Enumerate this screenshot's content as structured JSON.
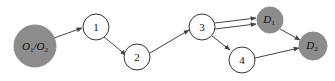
{
  "diagram": {
    "type": "directed-graph",
    "colors": {
      "background": "#ffffff",
      "terminal_fill": "#8c8c8c",
      "plain_fill": "#ffffff",
      "stroke": "#333333",
      "edge": "#444444"
    },
    "nodes": [
      {
        "id": "O",
        "label_main": "O",
        "label_sub1": "1",
        "label_sep": "/O",
        "label_sub2": "2",
        "type": "origin",
        "cx": 35,
        "cy": 46,
        "r": 21
      },
      {
        "id": "n1",
        "label": "1",
        "type": "intermediate",
        "cx": 96,
        "cy": 27,
        "r": 13
      },
      {
        "id": "n2",
        "label": "2",
        "type": "intermediate",
        "cx": 137,
        "cy": 57,
        "r": 13
      },
      {
        "id": "n3",
        "label": "3",
        "type": "intermediate",
        "cx": 202,
        "cy": 27,
        "r": 13
      },
      {
        "id": "n4",
        "label": "4",
        "type": "intermediate",
        "cx": 242,
        "cy": 60,
        "r": 13
      },
      {
        "id": "D1",
        "label_main": "D",
        "label_sub": "1",
        "type": "destination",
        "cx": 270,
        "cy": 20,
        "r": 13
      },
      {
        "id": "D2",
        "label_main": "D",
        "label_sub": "2",
        "type": "destination",
        "cx": 313,
        "cy": 46,
        "r": 14
      }
    ],
    "edges": [
      {
        "from": "O",
        "to": "n1"
      },
      {
        "from": "n1",
        "to": "n2"
      },
      {
        "from": "n2",
        "to": "n3"
      },
      {
        "from": "n3",
        "to": "D1",
        "note": "upper of parallel pair"
      },
      {
        "from": "n3",
        "to": "D1",
        "note": "lower of parallel pair"
      },
      {
        "from": "n3",
        "to": "n4"
      },
      {
        "from": "D1",
        "to": "D2"
      },
      {
        "from": "n4",
        "to": "D2"
      }
    ]
  }
}
